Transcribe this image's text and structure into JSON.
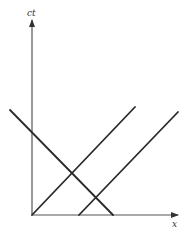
{
  "diagram": {
    "type": "spacetime-diagram",
    "colors": {
      "background": "#ffffff",
      "axis": "#555555",
      "line": "#2a2a2a",
      "label": "#333333"
    },
    "axes": {
      "vertical": {
        "label": "ct",
        "from": [
          32,
          215
        ],
        "to": [
          32,
          20
        ]
      },
      "horizontal": {
        "label": "x",
        "from": [
          32,
          215
        ],
        "to": [
          178,
          215
        ]
      }
    },
    "lines": [
      {
        "name": "worldline-from-origin",
        "from": [
          32,
          215
        ],
        "to": [
          135,
          107
        ]
      },
      {
        "name": "worldline-offset",
        "from": [
          79,
          215
        ],
        "to": [
          178,
          112
        ]
      },
      {
        "name": "worldline-descending",
        "from": [
          10,
          110
        ],
        "to": [
          113,
          215
        ]
      }
    ],
    "label_positions": {
      "ct": [
        27,
        9
      ],
      "x": [
        172,
        220
      ]
    }
  }
}
